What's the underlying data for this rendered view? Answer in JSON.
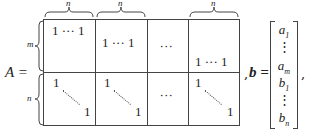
{
  "matrix": {
    "label": "A =",
    "col_block_labels": [
      "n",
      "n",
      "n"
    ],
    "row_block_labels": [
      "m",
      "n"
    ],
    "top_blocks": [
      {
        "text": "1 ··· 1"
      },
      {
        "text": "1 ··· 1"
      },
      {
        "text": "···"
      },
      {
        "text": "1 ··· 1"
      }
    ],
    "bottom_blocks": [
      {
        "start": "1",
        "end": "1"
      },
      {
        "start": "1",
        "end": "1"
      },
      {
        "text": "···"
      },
      {
        "start": "1",
        "end": "1"
      }
    ],
    "trailing_punct": ","
  },
  "vector": {
    "label": "b =",
    "entries": [
      {
        "base": "a",
        "sub": "1"
      },
      {
        "base": "⋮",
        "sub": ""
      },
      {
        "base": "a",
        "sub": "m"
      },
      {
        "base": "b",
        "sub": "1"
      },
      {
        "base": "⋮",
        "sub": ""
      },
      {
        "base": "b",
        "sub": "n"
      }
    ],
    "trailing_punct": ","
  }
}
